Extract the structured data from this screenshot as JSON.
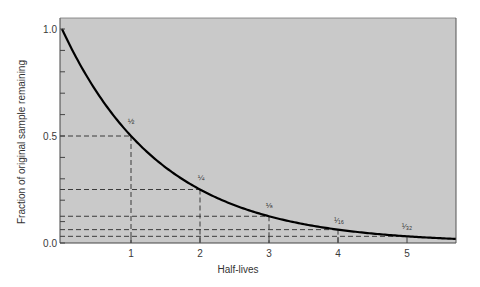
{
  "chart_data": {
    "type": "line",
    "title": "",
    "xlabel": "Half-lives",
    "ylabel": "Fraction of original sample remaining",
    "xlim": [
      0,
      5.7
    ],
    "ylim": [
      0,
      1.0
    ],
    "x_ticks": [
      1,
      2,
      3,
      4,
      5
    ],
    "x_tick_labels": [
      "1",
      "2",
      "3",
      "4",
      "5"
    ],
    "y_ticks_labeled": [
      0.0,
      0.5,
      1.0
    ],
    "y_tick_labels": [
      "0.0",
      "0.5",
      "1.0"
    ],
    "y_minor_tick_step": 0.1,
    "grid": false,
    "legend": null,
    "series": [
      {
        "name": "Fraction remaining (0.5^n)",
        "x": [
          0,
          1,
          2,
          3,
          4,
          5
        ],
        "values": [
          1.0,
          0.5,
          0.25,
          0.125,
          0.0625,
          0.03125
        ]
      }
    ],
    "annotations": [
      {
        "x": 1,
        "y": 0.5,
        "label": "½"
      },
      {
        "x": 2,
        "y": 0.25,
        "label": "¼"
      },
      {
        "x": 3,
        "y": 0.125,
        "label": "⅛"
      },
      {
        "x": 4,
        "y": 0.0625,
        "label": "¹⁄₁₆"
      },
      {
        "x": 5,
        "y": 0.03125,
        "label": "¹⁄₃₂"
      }
    ],
    "reference_lines": "dashed lines from each half-life point to both axes",
    "colors": {
      "plot_background": "#c9c9c9",
      "curve": "#000000",
      "dashed": "#2a2a2a",
      "axis": "#444444"
    }
  }
}
